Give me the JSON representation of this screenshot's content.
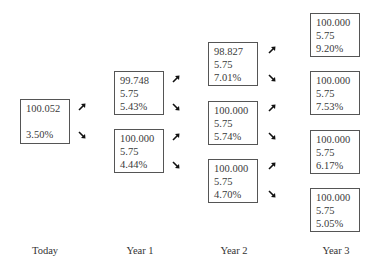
{
  "diagram": {
    "type": "binomial interest rate tree",
    "columns": [
      {
        "label": "Today",
        "nodes": [
          {
            "value": "100.052",
            "coupon": "",
            "rate": "3.50%"
          }
        ]
      },
      {
        "label": "Year 1",
        "nodes": [
          {
            "value": "99.748",
            "coupon": "5.75",
            "rate": "5.43%"
          },
          {
            "value": "100.000",
            "coupon": "5.75",
            "rate": "4.44%"
          }
        ]
      },
      {
        "label": "Year 2",
        "nodes": [
          {
            "value": "98.827",
            "coupon": "5.75",
            "rate": "7.01%"
          },
          {
            "value": "100.000",
            "coupon": "5.75",
            "rate": "5.74%"
          },
          {
            "value": "100.000",
            "coupon": "5.75",
            "rate": "4.70%"
          }
        ]
      },
      {
        "label": "Year 3",
        "nodes": [
          {
            "value": "100.000",
            "coupon": "5.75",
            "rate": "9.20%"
          },
          {
            "value": "100.000",
            "coupon": "5.75",
            "rate": "7.53%"
          },
          {
            "value": "100.000",
            "coupon": "5.75",
            "rate": "6.17%"
          },
          {
            "value": "100.000",
            "coupon": "5.75",
            "rate": "5.05%"
          }
        ]
      }
    ],
    "arrow_icons": {
      "up": "arrow-up-right-icon",
      "down": "arrow-down-right-icon"
    }
  }
}
